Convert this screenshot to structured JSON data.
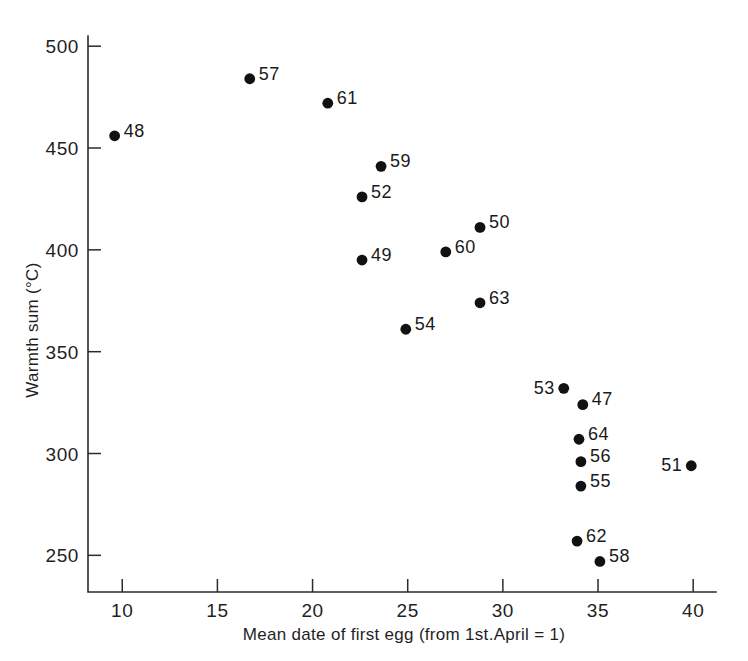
{
  "chart_data": {
    "type": "scatter",
    "title": "",
    "xlabel": "Mean date of first egg (from 1st.April = 1)",
    "ylabel": "Warmth sum (°C)",
    "xlim": [
      8.2,
      41.2
    ],
    "ylim": [
      232,
      505
    ],
    "xticks": [
      10,
      15,
      20,
      25,
      30,
      35,
      40
    ],
    "xtick_labels": [
      "10",
      "15",
      "20",
      "25",
      "30",
      "35",
      "40"
    ],
    "yticks": [
      250,
      300,
      350,
      400,
      450,
      500
    ],
    "ytick_labels": [
      "250",
      "300",
      "350",
      "400",
      "450",
      "500"
    ],
    "grid": false,
    "legend": "none",
    "marker": "filled-circle",
    "marker_color": "#111111",
    "points": [
      {
        "label": "48",
        "x": 9.6,
        "y": 456,
        "label_side": "right"
      },
      {
        "label": "57",
        "x": 16.7,
        "y": 484,
        "label_side": "right"
      },
      {
        "label": "61",
        "x": 20.8,
        "y": 472,
        "label_side": "right"
      },
      {
        "label": "59",
        "x": 23.6,
        "y": 441,
        "label_side": "right"
      },
      {
        "label": "52",
        "x": 22.6,
        "y": 426,
        "label_side": "right"
      },
      {
        "label": "49",
        "x": 22.6,
        "y": 395,
        "label_side": "right"
      },
      {
        "label": "50",
        "x": 28.8,
        "y": 411,
        "label_side": "right"
      },
      {
        "label": "60",
        "x": 27.0,
        "y": 399,
        "label_side": "right"
      },
      {
        "label": "63",
        "x": 28.8,
        "y": 374,
        "label_side": "right"
      },
      {
        "label": "54",
        "x": 24.9,
        "y": 361,
        "label_side": "right"
      },
      {
        "label": "53",
        "x": 33.2,
        "y": 332,
        "label_side": "left"
      },
      {
        "label": "47",
        "x": 34.2,
        "y": 324,
        "label_side": "right"
      },
      {
        "label": "64",
        "x": 34.0,
        "y": 307,
        "label_side": "right"
      },
      {
        "label": "56",
        "x": 34.1,
        "y": 296,
        "label_side": "right"
      },
      {
        "label": "55",
        "x": 34.1,
        "y": 284,
        "label_side": "right"
      },
      {
        "label": "51",
        "x": 39.9,
        "y": 294,
        "label_side": "left"
      },
      {
        "label": "62",
        "x": 33.9,
        "y": 257,
        "label_side": "right"
      },
      {
        "label": "58",
        "x": 35.1,
        "y": 247,
        "label_side": "right"
      }
    ]
  }
}
